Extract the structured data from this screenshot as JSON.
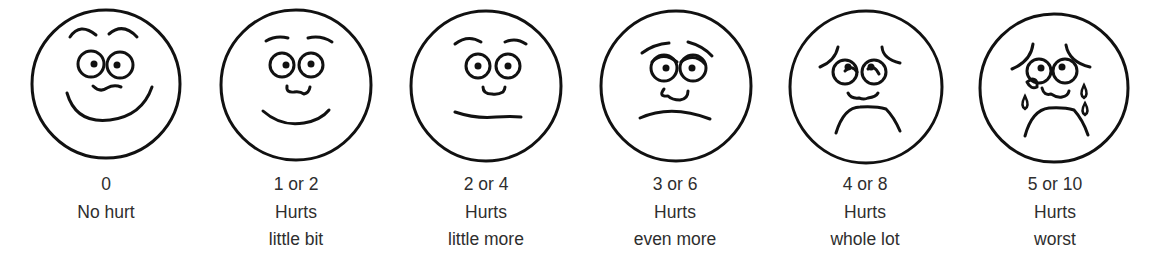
{
  "scale": [
    {
      "score": "0",
      "line1": "No hurt",
      "line2": ""
    },
    {
      "score": "1 or 2",
      "line1": "Hurts",
      "line2": "little bit"
    },
    {
      "score": "2 or 4",
      "line1": "Hurts",
      "line2": "little more"
    },
    {
      "score": "3 or 6",
      "line1": "Hurts",
      "line2": "even more"
    },
    {
      "score": "4 or 8",
      "line1": "Hurts",
      "line2": "whole lot"
    },
    {
      "score": "5 or 10",
      "line1": "Hurts",
      "line2": "worst"
    }
  ],
  "icons": [
    "smiling-face-icon",
    "slight-smile-face-icon",
    "neutral-face-icon",
    "frowning-face-icon",
    "sad-face-icon",
    "crying-face-icon"
  ],
  "colors": {
    "ink": "#111111",
    "text": "#2e2e2e",
    "background": "#ffffff"
  }
}
